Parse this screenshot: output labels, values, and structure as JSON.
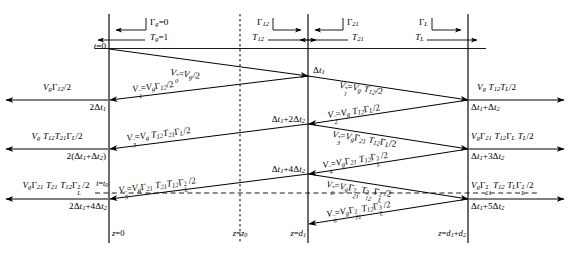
{
  "figure": {
    "type": "bounce-diagram",
    "background_color": "#ffffff",
    "line_color": "#000000",
    "axis": {
      "time_direction": "downward",
      "space_direction": "rightward",
      "t_origin_label": "t=0",
      "t_marker_label": "t=t0",
      "dashed_observation_line": true
    },
    "vertical_lines": [
      {
        "name": "source-plane",
        "label": "z=0",
        "x": 109,
        "style": "solid"
      },
      {
        "name": "observation-plane",
        "label": "z=z0",
        "x": 240,
        "style": "dashed"
      },
      {
        "name": "junction-plane",
        "label": "z=d1",
        "x": 308,
        "style": "solid"
      },
      {
        "name": "load-plane",
        "label": "z=d1+d2",
        "x": 468,
        "style": "solid"
      }
    ],
    "interface_coefficients": [
      {
        "name": "gamma-g",
        "reflection": "Γg=0",
        "transmission": "Tg=1",
        "plane": "source-plane"
      },
      {
        "name": "gamma-12",
        "reflection": "Γ12",
        "transmission": "T12",
        "plane": "junction-plane-left"
      },
      {
        "name": "gamma-21",
        "reflection": "Γ21",
        "transmission": "T21",
        "plane": "junction-plane-right"
      },
      {
        "name": "gamma-L",
        "reflection": "ΓL",
        "transmission": "TL",
        "plane": "load-plane"
      }
    ],
    "waves": [
      {
        "id": "V0+",
        "label": "V0+=Vg/2",
        "direction": "forward",
        "from": "z=0",
        "to": "z=d1"
      },
      {
        "id": "V1-",
        "label": "V1-=VgΓ12/2",
        "direction": "backward",
        "from": "z=d1",
        "to": "z=0"
      },
      {
        "id": "V1+",
        "label": "V1+=VgT12/2",
        "direction": "forward",
        "from": "z=d1",
        "to": "z=d1+d2"
      },
      {
        "id": "V2-",
        "label": "V2-=VgT12ΓL/2",
        "direction": "backward",
        "from": "z=d1+d2",
        "to": "z=d1"
      },
      {
        "id": "V3-",
        "label": "V3-=VgT12T21ΓL/2",
        "direction": "backward",
        "from": "z=d1",
        "to": "z=0"
      },
      {
        "id": "V3+",
        "label": "V3+=VgΓ21T12ΓL/2",
        "direction": "forward",
        "from": "z=d1",
        "to": "z=d1+d2"
      },
      {
        "id": "V4-",
        "label": "V4-=VgΓ21T12ΓL2/2",
        "direction": "backward",
        "from": "z=d1+d2",
        "to": "z=d1"
      },
      {
        "id": "V5-",
        "label": "V5-=VgΓ21T21T12ΓL2/2",
        "direction": "backward",
        "from": "z=d1",
        "to": "z=0"
      },
      {
        "id": "V5+",
        "label": "V5+=VgΓ212T122ΓL2/2",
        "direction": "forward",
        "from": "z=d1",
        "to": "z=d1+d2"
      },
      {
        "id": "V6-",
        "label": "V6-=VgΓ212T12ΓL3/2",
        "direction": "backward",
        "from": "z=d1+d2",
        "to": "z=d1"
      }
    ],
    "left_exit_arrows": [
      {
        "amplitude": "VgΓ12/2",
        "time": "2Δt1"
      },
      {
        "amplitude": "VgT12T21ΓL/2",
        "time": "2(Δt1+Δt2)"
      },
      {
        "amplitude": "VgΓ21T21T12ΓL2/2",
        "time": "2Δt1+4Δt2"
      }
    ],
    "right_exit_arrows": [
      {
        "amplitude": "VgT12TL/2",
        "time": "Δt1+Δt2"
      },
      {
        "amplitude": "VgΓ21T12ΓLTL/2",
        "time": "Δt1+3Δt2"
      },
      {
        "amplitude": "VgΓ212T12TLΓL2/2",
        "time": "Δt1+5Δt2"
      }
    ],
    "junction_time_labels": [
      "Δt1",
      "Δt1+2Δt2",
      "Δt1+4Δt2"
    ]
  },
  "labels": {
    "t0": "t=0",
    "t_t0": "t=t0",
    "z0": "z=0",
    "zz0": "z=z0",
    "zd1": "z=d1",
    "zd1d2": "z=d1+d2",
    "gamma_g": "Γg=0",
    "T_g": "Tg=1",
    "gamma_12": "Γ12",
    "T_12": "T12",
    "gamma_21": "Γ21",
    "T_21": "T21",
    "gamma_L": "ΓL",
    "T_L": "TL",
    "dt1": "Δt1",
    "dt1_2dt2": "Δt1+2Δt2",
    "dt1_4dt2": "Δt1+4Δt2",
    "two_dt1": "2Δt1",
    "two_dt1_dt2": "2(Δt1+Δt2)",
    "two_dt1_4dt2": "2Δt1+4Δt2",
    "dt1_dt2": "Δt1+Δt2",
    "dt1_3dt2": "Δt1+3Δt2",
    "dt1_5dt2": "Δt1+5Δt2"
  }
}
